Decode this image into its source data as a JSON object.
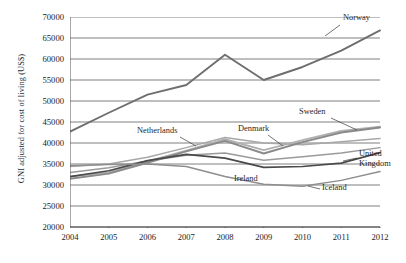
{
  "chart_data": {
    "type": "line",
    "title": "",
    "xlabel": "",
    "ylabel": "GNI adjusted for cost of living (US$)",
    "categories": [
      "2004",
      "2005",
      "2006",
      "2007",
      "2008",
      "2009",
      "2010",
      "2011",
      "2012"
    ],
    "x": [
      2004,
      2005,
      2006,
      2007,
      2008,
      2009,
      2010,
      2011,
      2012
    ],
    "xlim": [
      2004,
      2012
    ],
    "ylim": [
      20000,
      70000
    ],
    "yticks": [
      20000,
      25000,
      30000,
      35000,
      40000,
      45000,
      50000,
      55000,
      60000,
      65000,
      70000
    ],
    "ytick_labels": [
      "20000",
      "25000",
      "30000",
      "35000",
      "40000",
      "45000",
      "50000",
      "55000",
      "60000",
      "65000",
      "70000"
    ],
    "grid": "horizontal",
    "legend": "inline-annotations",
    "series": [
      {
        "name": "Norway",
        "color": "#6e6e6e",
        "width": 1.9,
        "values": [
          42700,
          47200,
          51500,
          53800,
          61000,
          55000,
          58100,
          62000,
          66800
        ]
      },
      {
        "name": "Netherlands",
        "color": "#a8a8a8",
        "width": 1.5,
        "values": [
          34400,
          35000,
          36600,
          38900,
          41300,
          40000,
          39600,
          40300,
          41100
        ]
      },
      {
        "name": "Sweden",
        "color": "#b0b0b0",
        "width": 1.9,
        "values": [
          32000,
          33000,
          35600,
          38200,
          40900,
          38300,
          40700,
          42900,
          43900
        ]
      },
      {
        "name": "Denmark",
        "color": "#8a8a8a",
        "width": 1.9,
        "values": [
          31500,
          32700,
          35300,
          38000,
          40500,
          37500,
          40200,
          42500,
          43700
        ]
      },
      {
        "name": "United Kingdom",
        "color": "#9a9a9a",
        "width": 1.5,
        "values": [
          33000,
          34100,
          35700,
          37100,
          37600,
          35900,
          36700,
          37600,
          38900
        ]
      },
      {
        "name": "Ireland",
        "color": "#4a4a4a",
        "width": 1.7,
        "values": [
          32000,
          33400,
          35800,
          37300,
          36400,
          34200,
          34400,
          35200,
          37700
        ]
      },
      {
        "name": "Iceland",
        "color": "#8e8e8e",
        "width": 1.5,
        "values": [
          34600,
          34900,
          35000,
          34400,
          32000,
          30200,
          29700,
          31100,
          33200
        ]
      }
    ],
    "annotations": [
      {
        "name": "Norway",
        "label": "Norway",
        "x": 343,
        "y": 14,
        "leader": {
          "x1": 340,
          "y1": 25,
          "x2": 325,
          "y2": 36
        }
      },
      {
        "name": "Sweden",
        "label": "Sweden",
        "x": 299,
        "y": 108,
        "leader": {
          "x1": 331,
          "y1": 118,
          "x2": 357,
          "y2": 130
        }
      },
      {
        "name": "Denmark",
        "label": "Denmark",
        "x": 238,
        "y": 125,
        "leader": {
          "x1": 268,
          "y1": 135,
          "x2": 283,
          "y2": 146
        }
      },
      {
        "name": "Netherlands",
        "label": "Netherlands",
        "x": 137,
        "y": 127,
        "leader": {
          "x1": 180,
          "y1": 137,
          "x2": 196,
          "y2": 146
        }
      },
      {
        "name": "United Kingdom",
        "label": "United",
        "x": 359,
        "y": 150,
        "leader": {
          "x1": 357,
          "y1": 158,
          "x2": 343,
          "y2": 161
        }
      },
      {
        "name": "United Kingdom 2",
        "label": "Kingdom",
        "x": 359,
        "y": 160,
        "leader": null
      },
      {
        "name": "Ireland",
        "label": "Ireland",
        "x": 234,
        "y": 175,
        "leader": null
      },
      {
        "name": "Iceland",
        "label": "Iceland",
        "x": 322,
        "y": 184,
        "leader": {
          "x1": 320,
          "y1": 189,
          "x2": 308,
          "y2": 186
        }
      }
    ],
    "axis_color": "#555555",
    "grid_color": "#6f6f6f",
    "background": "#ffffff"
  }
}
